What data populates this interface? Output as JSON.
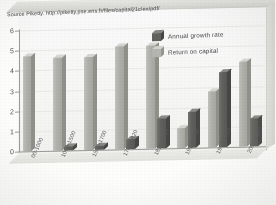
{
  "source_note": "Source Piketty.  http://piketty.pse.ens.fr/files/capital21c/en/pdf/",
  "legend": {
    "position": "top-right",
    "entries": [
      {
        "label": "Annual growth rate",
        "key": "annual-growth-rate",
        "color": "#5c5c59",
        "swatch": "dark"
      },
      {
        "label": "Return on capital",
        "key": "return-on-capital",
        "color": "#b6b6b1",
        "swatch": "light"
      }
    ]
  },
  "axis": {
    "y_ticks": [
      "6",
      "5",
      "4",
      "3",
      "2",
      "1",
      "0"
    ],
    "y_values": [
      6,
      5,
      4,
      3,
      2,
      1,
      0
    ]
  },
  "chart_data": {
    "type": "bar",
    "title": "",
    "subtitle": "",
    "xlabel": "",
    "ylabel": "",
    "ylim": [
      0,
      6
    ],
    "ytick_step": 1,
    "grid": true,
    "legend_position": "top-right",
    "style": "3d-clustered-bar",
    "categories": [
      "00-1000",
      "1000-1500",
      "1500-1700",
      "1700-1820",
      "1820-1913",
      "1913-1950",
      "1950-2012",
      "2050-2100"
    ],
    "series": [
      {
        "name": "Return on capital",
        "color": "#b6b6b1",
        "values": [
          4.7,
          4.6,
          4.6,
          5.1,
          5.1,
          1.0,
          2.8,
          4.2
        ]
      },
      {
        "name": "Annual growth rate",
        "color": "#5c5c59",
        "values": [
          0.0,
          0.2,
          0.2,
          0.5,
          1.5,
          1.8,
          3.7,
          1.4
        ]
      }
    ]
  }
}
